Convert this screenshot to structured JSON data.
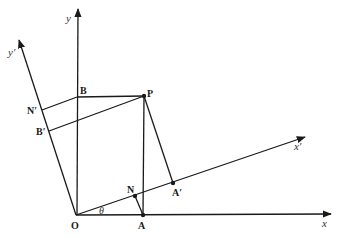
{
  "diagram": {
    "axes": {
      "x": "x",
      "y": "y",
      "x_prime": "x′",
      "y_prime": "y′"
    },
    "points": {
      "O": "O",
      "A": "A",
      "B": "B",
      "P": "P",
      "N": "N",
      "A_prime": "A′",
      "B_prime": "B′",
      "N_prime": "N′"
    },
    "angle_label": "θ",
    "line_color": "#1a1a1a"
  }
}
